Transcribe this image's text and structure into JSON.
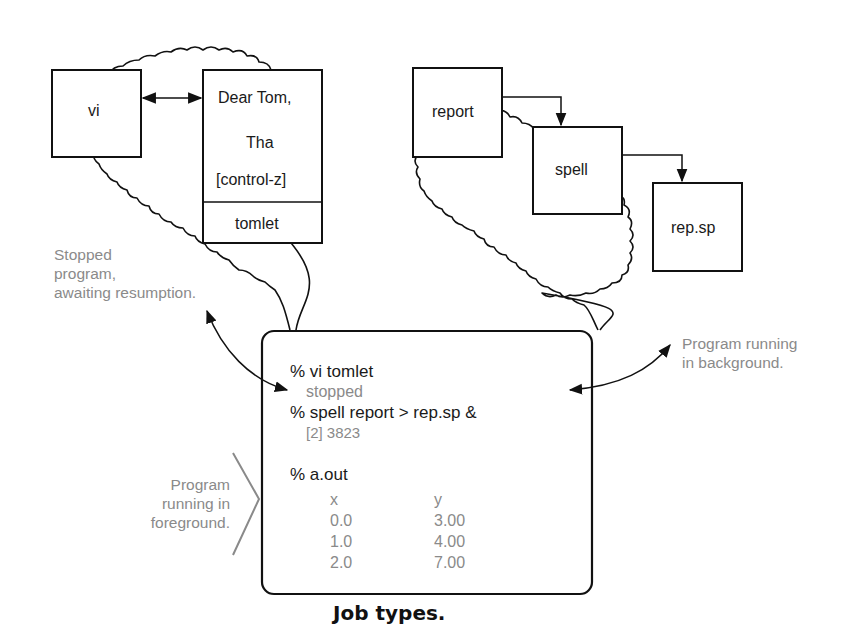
{
  "caption": "Job types.",
  "stopped_job": {
    "process_box": {
      "label": "vi"
    },
    "file_box": {
      "lines": [
        "Dear Tom,",
        "Tha",
        "[control-z]"
      ],
      "filename": "tomlet"
    }
  },
  "background_job": {
    "boxes": [
      {
        "label": "report"
      },
      {
        "label": "spell"
      },
      {
        "label": "rep.sp"
      }
    ]
  },
  "annotations": {
    "stopped": [
      "Stopped",
      "program,",
      "awaiting resumption."
    ],
    "background": [
      "Program running",
      "in background."
    ],
    "foreground": [
      "Program",
      "running in",
      "foreground."
    ]
  },
  "terminal": {
    "lines": [
      {
        "text": "% vi tomlet",
        "kind": "command"
      },
      {
        "text": "stopped",
        "kind": "output"
      },
      {
        "text": "% spell report > rep.sp &",
        "kind": "command"
      },
      {
        "text": "[2] 3823",
        "kind": "output"
      },
      {
        "text": "% a.out",
        "kind": "command"
      }
    ],
    "table": {
      "headers": [
        "x",
        "y"
      ],
      "rows": [
        [
          "0.0",
          "3.00"
        ],
        [
          "1.0",
          "4.00"
        ],
        [
          "2.0",
          "7.00"
        ]
      ]
    }
  },
  "colors": {
    "ink": "#1a1a1a",
    "annotation_gray": "#8a8a8a",
    "background": "#ffffff"
  }
}
